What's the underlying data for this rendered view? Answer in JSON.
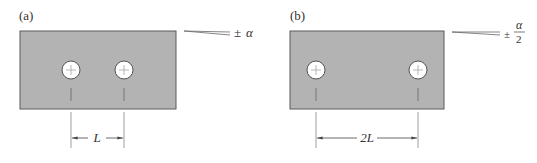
{
  "panels": [
    {
      "id": "a",
      "label": "(a)",
      "dimension_label": "L",
      "angle_prefix": "±",
      "angle_symbol": "α",
      "angle_denominator": ""
    },
    {
      "id": "b",
      "label": "(b)",
      "dimension_label": "2L",
      "angle_prefix": "±",
      "angle_symbol": "α",
      "angle_denominator": "2"
    }
  ],
  "colors": {
    "plate_fill": "#b3b3b3",
    "plate_stroke": "#5a5a5a",
    "line": "#555555",
    "hole_fill": "#ffffff"
  }
}
